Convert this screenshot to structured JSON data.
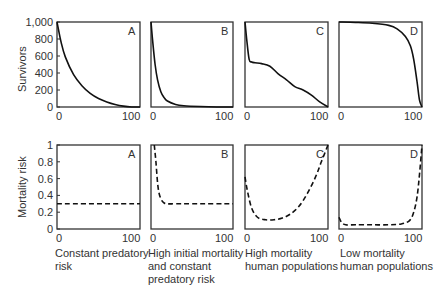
{
  "chart_data": [
    {
      "type": "line",
      "row": "survivorship",
      "ylabel": "Survivors",
      "ylim": [
        0,
        1000
      ],
      "yticks": [
        "0",
        "200",
        "400",
        "600",
        "800",
        "1,000"
      ],
      "xlim": [
        0,
        100
      ],
      "xticks": [
        "0",
        "100"
      ],
      "grid": false,
      "panels": [
        {
          "id": "A",
          "line_style": "solid",
          "x": [
            0,
            5,
            10,
            20,
            30,
            40,
            50,
            60,
            70,
            80,
            90,
            100
          ],
          "y": [
            1000,
            760,
            590,
            380,
            250,
            160,
            100,
            60,
            30,
            10,
            0,
            0
          ]
        },
        {
          "id": "B",
          "line_style": "solid",
          "x": [
            0,
            2,
            5,
            8,
            12,
            16,
            20,
            30,
            40,
            60,
            80,
            100
          ],
          "y": [
            1000,
            780,
            500,
            320,
            180,
            110,
            70,
            30,
            15,
            5,
            0,
            0
          ]
        },
        {
          "id": "C",
          "line_style": "solid",
          "x": [
            0,
            2,
            5,
            8,
            12,
            20,
            30,
            40,
            50,
            60,
            70,
            80,
            90,
            100
          ],
          "y": [
            1000,
            800,
            560,
            530,
            520,
            510,
            480,
            390,
            320,
            240,
            200,
            140,
            60,
            0
          ]
        },
        {
          "id": "D",
          "line_style": "solid",
          "x": [
            0,
            20,
            40,
            60,
            70,
            80,
            86,
            90,
            94,
            97,
            100
          ],
          "y": [
            1000,
            995,
            985,
            960,
            920,
            830,
            720,
            560,
            300,
            80,
            0
          ]
        }
      ]
    },
    {
      "type": "line",
      "row": "mortality",
      "ylabel": "Mortality risk",
      "ylim": [
        0,
        1
      ],
      "yticks": [
        "0",
        "0.2",
        "0.4",
        "0.6",
        "0.8",
        "1"
      ],
      "xlim": [
        0,
        100
      ],
      "xticks": [
        "0",
        "100"
      ],
      "grid": false,
      "panels": [
        {
          "id": "A",
          "line_style": "dashed",
          "caption": "Constant predatory risk",
          "x": [
            0,
            100
          ],
          "y": [
            0.3,
            0.3
          ]
        },
        {
          "id": "B",
          "line_style": "dashed",
          "caption": "High initial mortality and constant predatory risk",
          "x": [
            4,
            6,
            8,
            10,
            13,
            16,
            20,
            30,
            50,
            100
          ],
          "y": [
            1.0,
            0.8,
            0.55,
            0.42,
            0.34,
            0.31,
            0.3,
            0.3,
            0.3,
            0.3
          ]
        },
        {
          "id": "C",
          "line_style": "dashed",
          "caption": "High mortality human populations",
          "x": [
            0,
            3,
            8,
            15,
            25,
            35,
            45,
            55,
            65,
            75,
            85,
            92,
            100
          ],
          "y": [
            0.62,
            0.45,
            0.25,
            0.14,
            0.11,
            0.11,
            0.13,
            0.18,
            0.27,
            0.42,
            0.62,
            0.8,
            1.0
          ]
        },
        {
          "id": "D",
          "line_style": "dashed",
          "caption": "Low mortality human populations",
          "x": [
            0,
            3,
            8,
            20,
            40,
            60,
            75,
            85,
            90,
            94,
            97,
            100
          ],
          "y": [
            0.14,
            0.08,
            0.05,
            0.05,
            0.05,
            0.05,
            0.06,
            0.1,
            0.2,
            0.38,
            0.65,
            1.0
          ]
        }
      ]
    }
  ],
  "captions": {
    "A": [
      "Constant predatory",
      "risk"
    ],
    "B": [
      "High initial mortality",
      "and constant",
      "predatory risk"
    ],
    "C": [
      "High mortality",
      "human populations"
    ],
    "D": [
      "Low mortality",
      "human populations"
    ]
  },
  "labels": {
    "top_ylabel": "Survivors",
    "bottom_ylabel": "Mortality risk"
  }
}
